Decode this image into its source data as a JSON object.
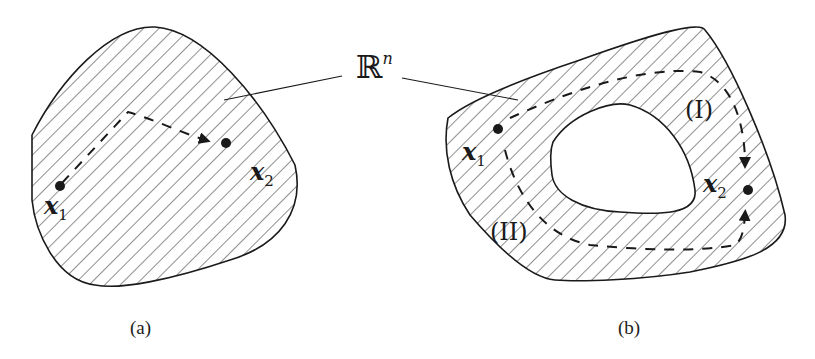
{
  "figure": {
    "space_label": "ℝ",
    "space_sup": "n",
    "panel_a": {
      "caption": "(a)",
      "point1": {
        "base": "x",
        "sub": "1"
      },
      "point2": {
        "base": "x",
        "sub": "2"
      }
    },
    "panel_b": {
      "caption": "(b)",
      "point1": {
        "base": "x",
        "sub": "1"
      },
      "point2": {
        "base": "x",
        "sub": "2"
      },
      "path1_label": "(I)",
      "path2_label": "(II)"
    },
    "colors": {
      "ink": "#1a1a1a",
      "hatch": "#333333",
      "background": "#ffffff"
    }
  }
}
